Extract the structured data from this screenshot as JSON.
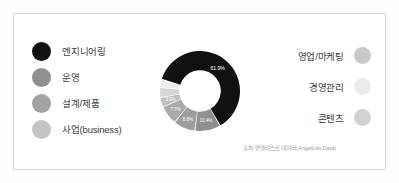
{
  "figure": {
    "caption": "출처 엔젤리스트 데이터(AngelList Data)",
    "frame_color": "#d8d8d8",
    "background": "#ffffff"
  },
  "legend_left": {
    "items": [
      {
        "label": "엔지니어링",
        "color": "#111111"
      },
      {
        "label": "운영",
        "color": "#8f8f8f"
      },
      {
        "label": "설계/제품",
        "color": "#a3a3a3"
      },
      {
        "label": "사업(business)",
        "color": "#c4c4c4"
      }
    ]
  },
  "legend_right": {
    "items": [
      {
        "label": "영업/마케팅",
        "color": "#c9c9c9"
      },
      {
        "label": "경영관리",
        "color": "#ebebeb"
      },
      {
        "label": "콘텐츠",
        "color": "#d2d2d2"
      }
    ]
  },
  "chart_data": {
    "type": "pie",
    "title": "",
    "subtype": "donut",
    "legend_position": "left-and-right",
    "hole_ratio": 0.52,
    "categories": [
      "엔지니어링",
      "사업(business)",
      "설계/제품",
      "운영",
      "영업/마케팅",
      "콘텐츠",
      "경영관리"
    ],
    "values": [
      61.9,
      10.4,
      8.8,
      7.7,
      3.9,
      4.0,
      3.3
    ],
    "unit": "%",
    "labels": [
      "61.9%",
      "10.4%",
      "8.8%",
      "7.7%",
      "3.9%",
      "",
      ""
    ],
    "colors": [
      "#111111",
      "#8f8f8f",
      "#9d9d9d",
      "#ababab",
      "#bdbdbd",
      "#d6d6d6",
      "#efefef"
    ],
    "label_color": "#ffffff",
    "source": "출처 엔젤리스트 데이터(AngelList Data)"
  }
}
